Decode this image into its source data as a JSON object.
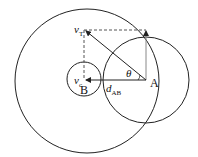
{
  "diagram": {
    "labels": {
      "point_a": "A",
      "point_b": "B",
      "vt": "v",
      "vt_sub": "T",
      "vc": "v",
      "vc_sub": "c",
      "theta": "θ",
      "dab": "d",
      "dab_sub": "AB"
    },
    "colors": {
      "stroke": "#222222",
      "dashed": "#555555",
      "background": "#ffffff"
    }
  }
}
